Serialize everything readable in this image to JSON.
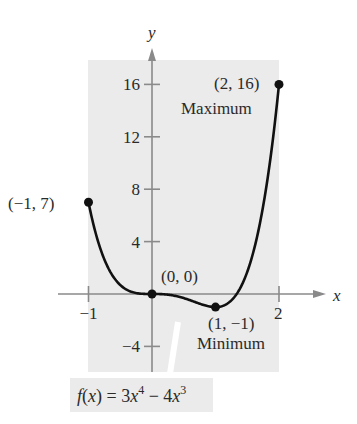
{
  "chart_data": {
    "type": "line",
    "title": "",
    "function_label": "f(x) = 3x^4 - 4x^3",
    "function_parts": {
      "f": "f",
      "x1": "x",
      "eq": ") = 3",
      "x2": "x",
      "e1": "4",
      "minus": " − 4",
      "x3": "x",
      "e2": "3"
    },
    "xlabel": "x",
    "ylabel": "y",
    "xlim": [
      -1.5,
      3.0
    ],
    "ylim": [
      -6,
      18
    ],
    "x_ticks": [
      {
        "v": -1,
        "label": "−1"
      },
      {
        "v": 2,
        "label": "2"
      }
    ],
    "y_ticks": [
      {
        "v": 16,
        "label": "16"
      },
      {
        "v": 12,
        "label": "12"
      },
      {
        "v": 8,
        "label": "8"
      },
      {
        "v": 4,
        "label": "4"
      },
      {
        "v": -4,
        "label": "−4"
      }
    ],
    "domain": [
      -1,
      2
    ],
    "series": [
      {
        "name": "f(x) = 3x^4 - 4x^3",
        "expression": "3x^4 - 4x^3"
      }
    ],
    "points": [
      {
        "x": -1,
        "y": 7,
        "label": "(−1, 7)",
        "note": ""
      },
      {
        "x": 0,
        "y": 0,
        "label": "(0, 0)",
        "note": ""
      },
      {
        "x": 1,
        "y": -1,
        "label": "(1, −1)",
        "note": "Minimum"
      },
      {
        "x": 2,
        "y": 16,
        "label": "(2, 16)",
        "note": "Maximum"
      }
    ],
    "grid": false,
    "colors": {
      "shade": "#ebebeb",
      "curve": "#111111",
      "axis": "#8a8a8a",
      "text": "#2a2a2a"
    }
  }
}
